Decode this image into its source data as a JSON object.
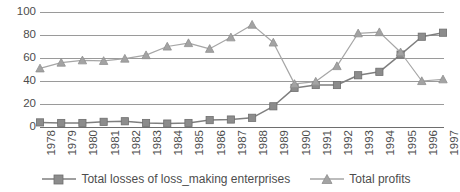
{
  "chart_data": {
    "type": "line",
    "title": "",
    "subtitle": "",
    "xlabel": "",
    "ylabel": "",
    "ylim": [
      0,
      100
    ],
    "yticks": [
      0,
      20,
      40,
      60,
      80,
      100
    ],
    "grid": true,
    "legend_position": "bottom",
    "categories": [
      "1978",
      "1979",
      "1980",
      "1981",
      "1982",
      "1983",
      "1984",
      "1985",
      "1986",
      "1987",
      "1988",
      "1989",
      "1990",
      "1991",
      "1992",
      "1993",
      "1994",
      "1995",
      "1996",
      "1997"
    ],
    "series": [
      {
        "name": "Total losses of loss_making enterprises",
        "marker": "square",
        "color": "#7f7f7f",
        "values": [
          4,
          3.5,
          3.5,
          4.5,
          5,
          3.5,
          3,
          3.5,
          6,
          6.5,
          8,
          18,
          34,
          36.5,
          36.5,
          45,
          48,
          63,
          78.5,
          82
        ]
      },
      {
        "name": "Total profits",
        "marker": "triangle",
        "color": "#a6a6a6",
        "values": [
          51,
          56,
          58,
          57.5,
          59.5,
          62.5,
          70,
          73,
          68,
          78,
          89,
          73.5,
          37.5,
          39.5,
          53,
          81.5,
          82.5,
          65,
          40,
          41.5
        ]
      }
    ]
  },
  "legend": {
    "items": [
      {
        "label": "Total losses of loss_making enterprises",
        "marker": "square-marker-icon"
      },
      {
        "label": "Total profits",
        "marker": "triangle-marker-icon"
      }
    ]
  },
  "colors": {
    "series_losses": "#7f7f7f",
    "series_profits": "#a6a6a6",
    "gridline": "#9a9a9a",
    "axis": "#6e6e6e",
    "text": "#4d4d4d",
    "background": "#ffffff"
  }
}
